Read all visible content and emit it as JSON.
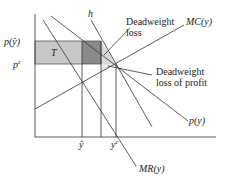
{
  "diagram": {
    "type": "economics-monopoly-diagram",
    "axes": {
      "y_ticks": [
        {
          "label": "p(ŷ)",
          "id": "p_hat"
        },
        {
          "label": "p",
          "sup": "c",
          "id": "p_c"
        }
      ],
      "x_ticks": [
        {
          "label": "ŷ",
          "id": "y_hat"
        },
        {
          "label": "y",
          "sup": "c",
          "id": "y_c"
        }
      ]
    },
    "curves": {
      "demand": "p(y)",
      "marginal_revenue": "MR(y)",
      "marginal_cost": "MC(y)",
      "h_line": "h"
    },
    "regions": {
      "transfer": "T"
    },
    "annotations": {
      "deadweight_loss": [
        "Deadweight",
        "loss"
      ],
      "deadweight_loss_profit": [
        "Deadweight",
        "loss of profit"
      ]
    },
    "colors": {
      "transfer_fill": "#c8c8c8",
      "dark_fill": "#8a8a8a",
      "triangle_fill": "#e4e4e4",
      "line": "#333333"
    }
  }
}
